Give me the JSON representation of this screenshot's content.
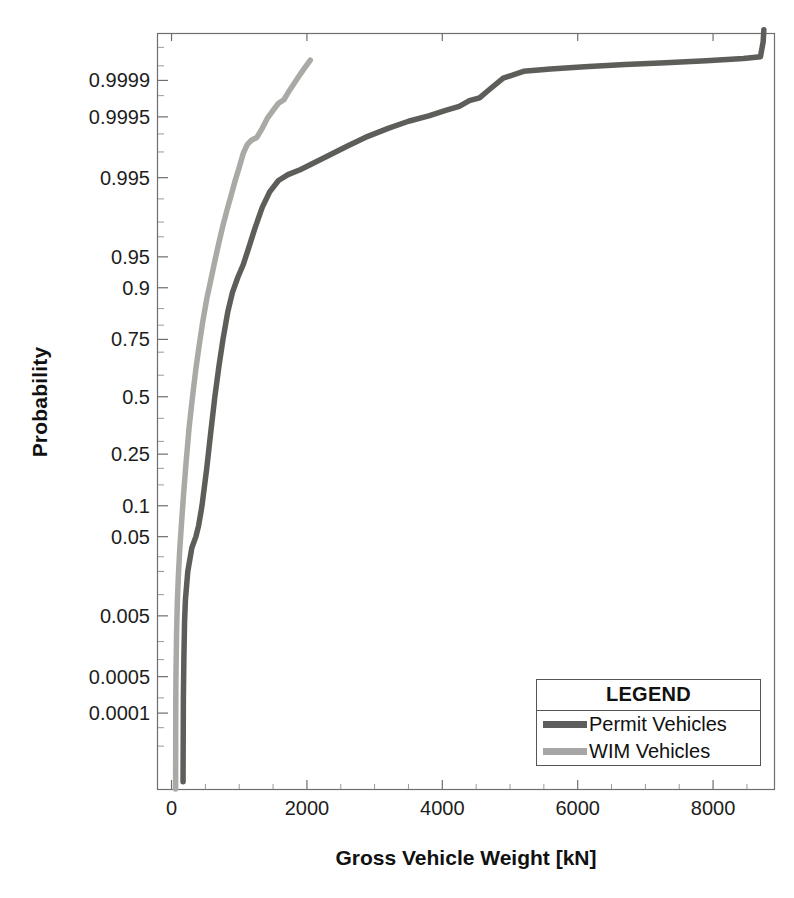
{
  "chart_data": {
    "type": "line",
    "title": "",
    "xlabel": "Gross Vehicle Weight [kN]",
    "ylabel": "Probability",
    "scale": "normal-probability",
    "grid": false,
    "xlim": [
      -200,
      8900
    ],
    "xticks": [
      0,
      2000,
      4000,
      6000,
      8000
    ],
    "xtick_labels": [
      "0",
      "2000",
      "4000",
      "6000",
      "8000"
    ],
    "yticks": [
      0.0001,
      0.0005,
      0.005,
      0.05,
      0.1,
      0.25,
      0.5,
      0.75,
      0.9,
      0.95,
      0.995,
      0.9995,
      0.9999
    ],
    "ytick_labels": [
      "0.0001",
      "0.0005",
      "0.005",
      "0.05",
      "0.1",
      "0.25",
      "0.5",
      "0.75",
      "0.9",
      "0.95",
      "0.995",
      "0.9995",
      "0.9999"
    ],
    "ylim": [
      2e-06,
      0.99999
    ],
    "legend": {
      "title": "LEGEND",
      "position": "lower-right",
      "entries": [
        {
          "label": "Permit Vehicles",
          "color": "#5d5d5d"
        },
        {
          "label": "WIM Vehicles",
          "color": "#a6a6a6"
        }
      ]
    },
    "series": [
      {
        "name": "Permit Vehicles",
        "color": "#5d5d5a",
        "points": [
          [
            170,
            3e-06
          ],
          [
            175,
            0.0002
          ],
          [
            182,
            0.001
          ],
          [
            192,
            0.004
          ],
          [
            205,
            0.0085
          ],
          [
            240,
            0.02
          ],
          [
            300,
            0.038
          ],
          [
            360,
            0.05
          ],
          [
            400,
            0.065
          ],
          [
            450,
            0.1
          ],
          [
            520,
            0.2
          ],
          [
            580,
            0.34
          ],
          [
            640,
            0.5
          ],
          [
            700,
            0.64
          ],
          [
            760,
            0.75
          ],
          [
            830,
            0.84
          ],
          [
            900,
            0.89
          ],
          [
            980,
            0.92
          ],
          [
            1060,
            0.94
          ],
          [
            1140,
            0.96
          ],
          [
            1230,
            0.976
          ],
          [
            1340,
            0.987
          ],
          [
            1450,
            0.992
          ],
          [
            1580,
            0.9945
          ],
          [
            1720,
            0.9955
          ],
          [
            1900,
            0.9962
          ],
          [
            2100,
            0.997
          ],
          [
            2350,
            0.9978
          ],
          [
            2600,
            0.9984
          ],
          [
            2900,
            0.9989
          ],
          [
            3200,
            0.9992
          ],
          [
            3500,
            0.9994
          ],
          [
            3800,
            0.99952
          ],
          [
            4050,
            0.99962
          ],
          [
            4250,
            0.99968
          ],
          [
            4400,
            0.99975
          ],
          [
            4550,
            0.99978
          ],
          [
            4700,
            0.99985
          ],
          [
            4900,
            0.99991
          ],
          [
            5200,
            0.999935
          ],
          [
            5600,
            0.999942
          ],
          [
            6100,
            0.999948
          ],
          [
            6700,
            0.999953
          ],
          [
            7300,
            0.999957
          ],
          [
            7900,
            0.999961
          ],
          [
            8450,
            0.999965
          ],
          [
            8700,
            0.999968
          ],
          [
            8740,
            0.999985
          ],
          [
            8750,
            0.999992
          ]
        ]
      },
      {
        "name": "WIM Vehicles",
        "color": "#a9a9a6",
        "points": [
          [
            60,
            2e-06
          ],
          [
            62,
            0.0001
          ],
          [
            64,
            0.00035
          ],
          [
            68,
            0.0009
          ],
          [
            75,
            0.003
          ],
          [
            85,
            0.0075
          ],
          [
            100,
            0.017
          ],
          [
            120,
            0.035
          ],
          [
            145,
            0.065
          ],
          [
            175,
            0.12
          ],
          [
            215,
            0.22
          ],
          [
            260,
            0.36
          ],
          [
            310,
            0.5
          ],
          [
            360,
            0.63
          ],
          [
            410,
            0.73
          ],
          [
            460,
            0.81
          ],
          [
            520,
            0.875
          ],
          [
            580,
            0.915
          ],
          [
            640,
            0.945
          ],
          [
            700,
            0.965
          ],
          [
            760,
            0.978
          ],
          [
            820,
            0.986
          ],
          [
            880,
            0.991
          ],
          [
            940,
            0.9945
          ],
          [
            1000,
            0.9965
          ],
          [
            1060,
            0.9979
          ],
          [
            1120,
            0.9985
          ],
          [
            1180,
            0.99872
          ],
          [
            1260,
            0.99885
          ],
          [
            1340,
            0.9992
          ],
          [
            1420,
            0.99948
          ],
          [
            1500,
            0.99962
          ],
          [
            1580,
            0.99972
          ],
          [
            1660,
            0.99976
          ],
          [
            1740,
            0.99984
          ],
          [
            1820,
            0.99989
          ],
          [
            1900,
            0.999925
          ],
          [
            1980,
            0.999948
          ],
          [
            2050,
            0.999962
          ]
        ]
      }
    ]
  }
}
